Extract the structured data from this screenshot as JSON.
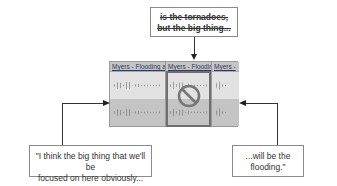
{
  "callouts": {
    "top": {
      "line1": "is the tornadoes,",
      "line2": "but the big thing...",
      "style": "strikethrough"
    },
    "left": {
      "line1": "\"I think the big thing that we'll be",
      "line2": "focused on here obviously..."
    },
    "right": {
      "line1": "...will be the",
      "line2": "flooding.\""
    }
  },
  "editor": {
    "clips": [
      {
        "label": "Myers - Flooding a"
      },
      {
        "label": "Myers - Floodin",
        "state": "removed"
      },
      {
        "label": "Myers -"
      }
    ],
    "removed_icon": "prohibited-icon"
  },
  "colors": {
    "frame": "#6f6f6f",
    "lane_light": "#e2e2e2",
    "lane_dark": "#c4c4c4",
    "clip_title": "#2e3a6a"
  }
}
